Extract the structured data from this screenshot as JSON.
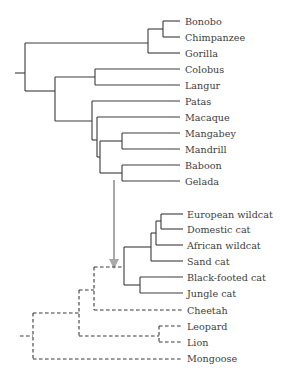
{
  "diagram": {
    "type": "phylogenetic-tree-comparison",
    "colors": {
      "branch": "#3a3a3a",
      "arrow": "#a8a8a8",
      "label": "#3d3d3d"
    },
    "primate_tree": {
      "line_style": "solid",
      "leaves": [
        "Bonobo",
        "Chimpanzee",
        "Gorilla",
        "Colobus",
        "Langur",
        "Patas",
        "Macaque",
        "Mangabey",
        "Mandrill",
        "Baboon",
        "Gelada"
      ]
    },
    "carnivore_tree": {
      "line_style": "mixed (solid for Felis clade, dashed for others)",
      "leaves": [
        "European wildcat",
        "Domestic cat",
        "African wildcat",
        "Sand cat",
        "Black-footed cat",
        "Jungle cat",
        "Cheetah",
        "Leopard",
        "Lion",
        "Mongoose"
      ]
    },
    "arrow": {
      "direction": "down",
      "meaning": "primate tree mapped onto cat clade"
    }
  }
}
